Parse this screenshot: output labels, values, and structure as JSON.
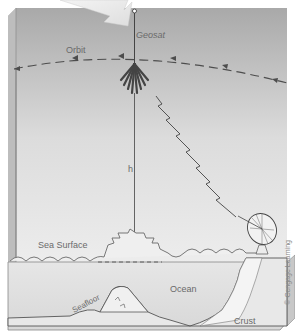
{
  "diagram": {
    "labels": {
      "satellite": "Geosat",
      "orbit": "Orbit",
      "height": "h",
      "sea_surface": "Sea Surface",
      "ocean": "Ocean",
      "seafloor": "Seafloor",
      "crust": "Crust"
    },
    "credit": "© Cengage Learning"
  }
}
